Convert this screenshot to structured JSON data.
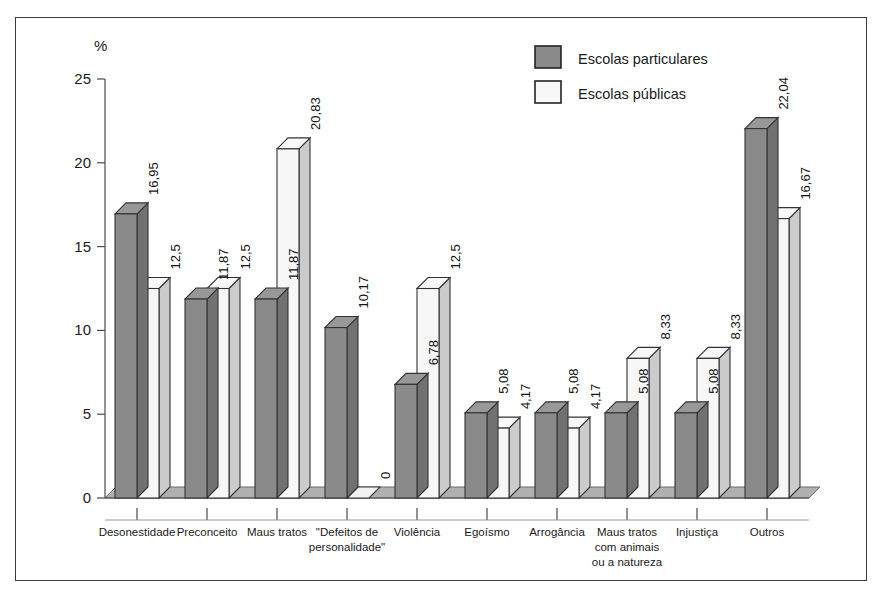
{
  "chart_data": {
    "type": "bar",
    "title": "",
    "subtitle": "",
    "xlabel": "",
    "ylabel": "%",
    "ylim": [
      0,
      25
    ],
    "yticks": [
      0,
      5,
      10,
      15,
      20,
      25
    ],
    "ytick_labels": [
      "0",
      "5",
      "10",
      "15",
      "20",
      "25"
    ],
    "grid": false,
    "legend_position": "top-right",
    "value_label_decimal_separator": ",",
    "categories": [
      "Desonestidade",
      "Preconceito",
      "Maus tratos",
      "\"Defeitos de personalidade\"",
      "Violência",
      "Egoísmo",
      "Arrogância",
      "Maus tratos com animais ou a natureza",
      "Injustiça",
      "Outros"
    ],
    "category_lines": [
      [
        "Desonestidade"
      ],
      [
        "Preconceito"
      ],
      [
        "Maus tratos"
      ],
      [
        "\"Defeitos de",
        "personalidade\""
      ],
      [
        "Violência"
      ],
      [
        "Egoísmo"
      ],
      [
        "Arrogância"
      ],
      [
        "Maus tratos",
        "com animais",
        "ou a natureza"
      ],
      [
        "Injustiça"
      ],
      [
        "Outros"
      ]
    ],
    "series": [
      {
        "name": "Escolas particulares",
        "color": "#8a8a8a",
        "values": [
          16.95,
          11.87,
          11.87,
          10.17,
          6.78,
          5.08,
          5.08,
          5.08,
          5.08,
          22.04
        ],
        "labels": [
          "16,95",
          "11,87",
          "11,87",
          "10,17",
          "6,78",
          "5,08",
          "5,08",
          "5,08",
          "5,08",
          "22,04"
        ]
      },
      {
        "name": "Escolas públicas",
        "color": "#f7f7f7",
        "values": [
          12.5,
          12.5,
          20.83,
          0,
          12.5,
          4.17,
          4.17,
          8.33,
          8.33,
          16.67
        ],
        "labels": [
          "12,5",
          "12,5",
          "20,83",
          "0",
          "12,5",
          "4,17",
          "4,17",
          "8,33",
          "8,33",
          "16,67"
        ]
      }
    ]
  },
  "legend": {
    "items": [
      {
        "label": "Escolas particulares",
        "color": "#8a8a8a"
      },
      {
        "label": "Escolas públicas",
        "color": "#f7f7f7"
      }
    ]
  },
  "axis": {
    "unit_label": "%"
  },
  "colors": {
    "series_private": "#8a8a8a",
    "series_public": "#f7f7f7",
    "floor": "#b0b0b0",
    "outline": "#333333",
    "frame": "#3a3a3a"
  }
}
